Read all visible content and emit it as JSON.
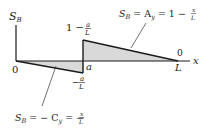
{
  "diagram": {
    "axes": {
      "y_label": "S",
      "y_label_sub": "B",
      "x_label": "x"
    },
    "points": {
      "origin_label": "0",
      "jump_label": "a",
      "end_label": "L",
      "end_value_label": "0"
    },
    "values": {
      "top_value_prefix": "1 −",
      "top_value_num": "a",
      "top_value_den": "L",
      "bottom_value_prefix": "−",
      "bottom_value_num": "a",
      "bottom_value_den": "L"
    },
    "equations": {
      "right": {
        "s": "S",
        "sub": "B",
        "mid": " = A",
        "mid_sub": "y",
        "rest": " = 1 −",
        "num": "x",
        "den": "L"
      },
      "left": {
        "s": "S",
        "sub": "B",
        "mid": " = − C",
        "mid_sub": "y",
        "rest": " = −",
        "num": "x",
        "den": "L"
      }
    },
    "colors": {
      "line": "#1a1a1a",
      "fill": "#d9d9d9"
    }
  }
}
